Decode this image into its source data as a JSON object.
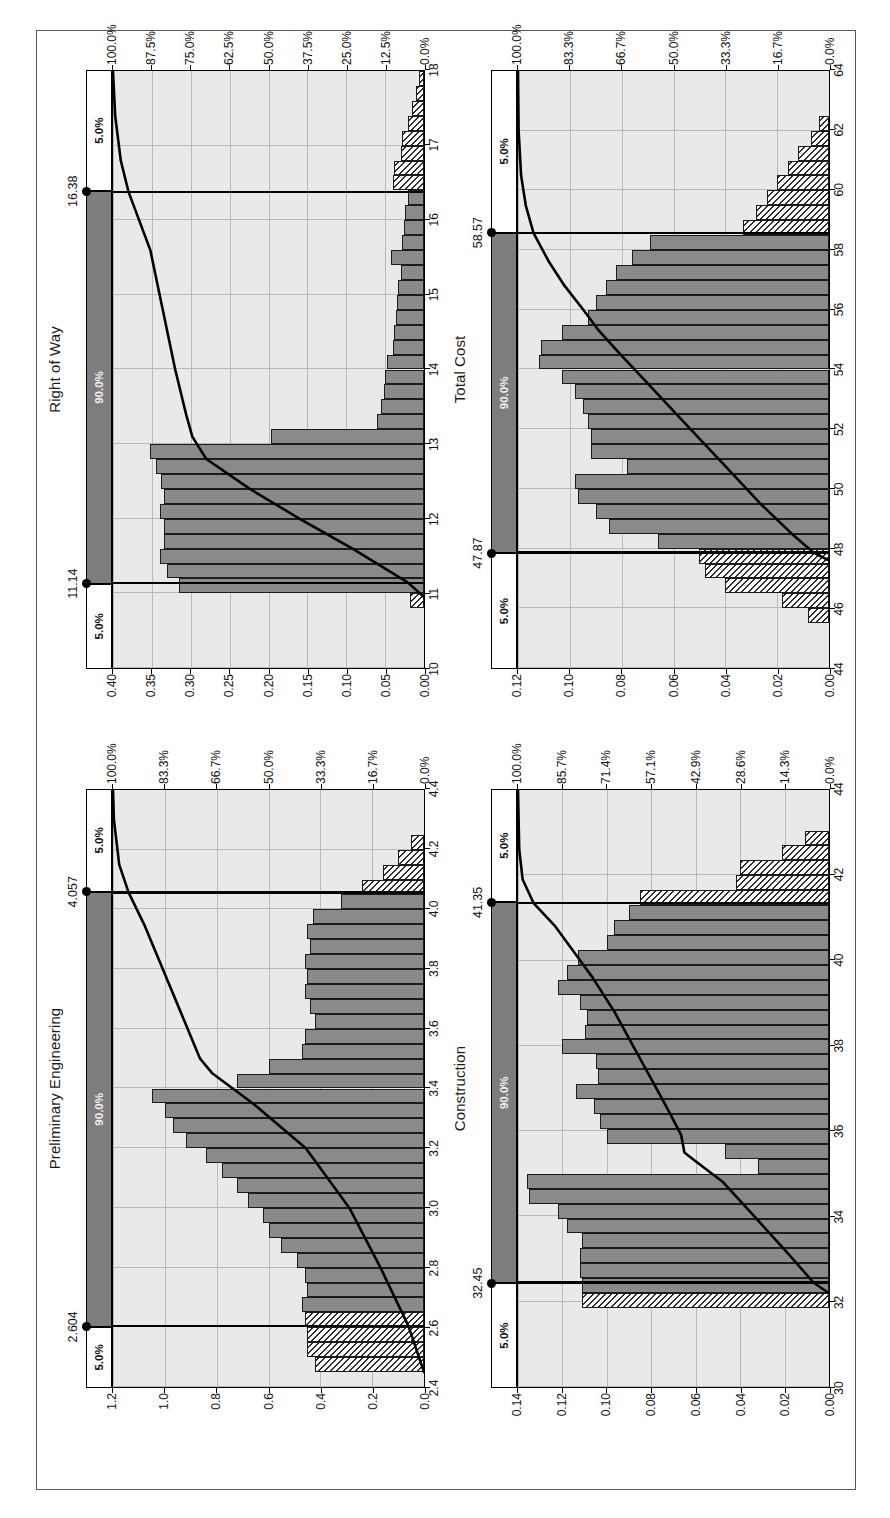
{
  "figure": {
    "orientation": "rotated-90-ccw",
    "panel_count": 4,
    "band_labels": {
      "lower_tail": "5.0%",
      "middle": "90.0%",
      "upper_tail": "5.0%"
    }
  },
  "chart_data": [
    {
      "type": "bar",
      "title": "Preliminary Engineering",
      "xlabel": "",
      "ylabel": "",
      "xlim": [
        2.4,
        4.4
      ],
      "ylim": [
        0.0,
        1.2
      ],
      "xticks": [
        "2.4",
        "2.6",
        "2.8",
        "3.0",
        "3.2",
        "3.4",
        "3.6",
        "3.8",
        "4.0",
        "4.2",
        "4.4"
      ],
      "yticks": [
        "0.0",
        "0.2",
        "0.4",
        "0.6",
        "0.8",
        "1.0",
        "1.2"
      ],
      "secondary_axis": {
        "label": "",
        "ticks": [
          "0.0%",
          "16.7%",
          "33.3%",
          "50.0%",
          "66.7%",
          "83.3%",
          "100.0%"
        ],
        "lim": [
          0,
          100
        ]
      },
      "percentiles": {
        "p5": "2.604",
        "p95": "4.057",
        "band": "90.0%",
        "tail": "5.0%"
      },
      "bin_width": 0.05,
      "bin_starts": [
        2.45,
        2.5,
        2.55,
        2.6,
        2.65,
        2.7,
        2.75,
        2.8,
        2.85,
        2.9,
        2.95,
        3.0,
        3.05,
        3.1,
        3.15,
        3.2,
        3.25,
        3.3,
        3.35,
        3.4,
        3.45,
        3.5,
        3.55,
        3.6,
        3.65,
        3.7,
        3.75,
        3.8,
        3.85,
        3.9,
        3.95,
        4.0,
        4.05,
        4.1,
        4.15,
        4.2
      ],
      "values": [
        0.42,
        0.45,
        0.45,
        0.46,
        0.47,
        0.45,
        0.46,
        0.49,
        0.55,
        0.6,
        0.62,
        0.68,
        0.72,
        0.78,
        0.84,
        0.92,
        0.97,
        1.0,
        1.05,
        0.72,
        0.6,
        0.47,
        0.46,
        0.42,
        0.44,
        0.46,
        0.45,
        0.46,
        0.44,
        0.45,
        0.43,
        0.32,
        0.24,
        0.16,
        0.1,
        0.05
      ],
      "tail_bins_low": [
        2.45,
        2.5,
        2.55,
        2.6
      ],
      "tail_bins_high": [
        4.05,
        4.1,
        4.15,
        4.2
      ],
      "cumulative_curve": [
        {
          "x": 2.45,
          "y": 0.0
        },
        {
          "x": 2.604,
          "y": 5.0
        },
        {
          "x": 2.8,
          "y": 14.0
        },
        {
          "x": 3.0,
          "y": 24.0
        },
        {
          "x": 3.2,
          "y": 38.0
        },
        {
          "x": 3.35,
          "y": 55.0
        },
        {
          "x": 3.45,
          "y": 68.0
        },
        {
          "x": 3.5,
          "y": 72.0
        },
        {
          "x": 3.65,
          "y": 78.0
        },
        {
          "x": 3.8,
          "y": 84.0
        },
        {
          "x": 3.95,
          "y": 90.0
        },
        {
          "x": 4.057,
          "y": 95.0
        },
        {
          "x": 4.15,
          "y": 98.0
        },
        {
          "x": 4.3,
          "y": 99.7
        },
        {
          "x": 4.4,
          "y": 100.0
        }
      ]
    },
    {
      "type": "bar",
      "title": "Right of Way",
      "xlabel": "",
      "ylabel": "",
      "xlim": [
        10,
        18
      ],
      "ylim": [
        0.0,
        0.4
      ],
      "xticks": [
        "10",
        "11",
        "12",
        "13",
        "14",
        "15",
        "16",
        "17",
        "18"
      ],
      "yticks": [
        "0.00",
        "0.05",
        "0.10",
        "0.15",
        "0.20",
        "0.25",
        "0.30",
        "0.35",
        "0.40"
      ],
      "secondary_axis": {
        "label": "",
        "ticks": [
          "0.0%",
          "12.5%",
          "25.0%",
          "37.5%",
          "50.0%",
          "62.5%",
          "75.0%",
          "87.5%",
          "100.0%"
        ],
        "lim": [
          0,
          100
        ]
      },
      "percentiles": {
        "p5": "11.14",
        "p95": "16.38",
        "band": "90.0%",
        "tail": "5.0%"
      },
      "bin_width": 0.2,
      "bin_starts": [
        10.8,
        11.0,
        11.2,
        11.4,
        11.6,
        11.8,
        12.0,
        12.2,
        12.4,
        12.6,
        12.8,
        13.0,
        13.2,
        13.4,
        13.6,
        13.8,
        14.0,
        14.2,
        14.4,
        14.6,
        14.8,
        15.0,
        15.2,
        15.4,
        15.6,
        15.8,
        16.0,
        16.2,
        16.4,
        16.6,
        16.8,
        17.0,
        17.2,
        17.4,
        17.6,
        17.8
      ],
      "values": [
        0.018,
        0.315,
        0.33,
        0.34,
        0.335,
        0.335,
        0.34,
        0.335,
        0.338,
        0.345,
        0.352,
        0.197,
        0.06,
        0.055,
        0.052,
        0.05,
        0.048,
        0.04,
        0.038,
        0.036,
        0.035,
        0.033,
        0.03,
        0.042,
        0.028,
        0.026,
        0.024,
        0.02,
        0.04,
        0.038,
        0.03,
        0.028,
        0.02,
        0.016,
        0.01,
        0.006
      ],
      "tail_bins_low": [
        10.8
      ],
      "tail_bins_high": [
        16.4,
        16.6,
        16.8,
        17.0,
        17.2,
        17.4,
        17.6,
        17.8
      ],
      "cumulative_curve": [
        {
          "x": 10.95,
          "y": 0.0
        },
        {
          "x": 11.14,
          "y": 5.0
        },
        {
          "x": 11.6,
          "y": 23.0
        },
        {
          "x": 12.0,
          "y": 40.0
        },
        {
          "x": 12.4,
          "y": 56.0
        },
        {
          "x": 12.8,
          "y": 70.0
        },
        {
          "x": 13.0,
          "y": 73.0
        },
        {
          "x": 13.1,
          "y": 74.5
        },
        {
          "x": 13.4,
          "y": 76.5
        },
        {
          "x": 14.0,
          "y": 80.0
        },
        {
          "x": 14.8,
          "y": 84.0
        },
        {
          "x": 15.6,
          "y": 88.0
        },
        {
          "x": 16.38,
          "y": 95.0
        },
        {
          "x": 16.8,
          "y": 97.5
        },
        {
          "x": 17.4,
          "y": 99.3
        },
        {
          "x": 18.0,
          "y": 100.0
        }
      ]
    },
    {
      "type": "bar",
      "title": "Construction",
      "xlabel": "",
      "ylabel": "",
      "xlim": [
        30,
        44
      ],
      "ylim": [
        0.0,
        0.14
      ],
      "xticks": [
        "30",
        "32",
        "34",
        "36",
        "38",
        "40",
        "42",
        "44"
      ],
      "yticks": [
        "0.00",
        "0.02",
        "0.04",
        "0.06",
        "0.08",
        "0.10",
        "0.12",
        "0.14"
      ],
      "secondary_axis": {
        "label": "",
        "ticks": [
          "0.0%",
          "14.3%",
          "28.6%",
          "42.9%",
          "57.1%",
          "71.4%",
          "85.7%",
          "100.0%"
        ],
        "lim": [
          0,
          100
        ]
      },
      "percentiles": {
        "p5": "32.45",
        "p95": "41.35",
        "band": "90.0%",
        "tail": "5.0%"
      },
      "bin_width": 0.35,
      "bin_starts": [
        31.85,
        32.2,
        32.55,
        32.9,
        33.25,
        33.6,
        33.95,
        34.3,
        34.65,
        35.0,
        35.35,
        35.7,
        36.05,
        36.4,
        36.75,
        37.1,
        37.45,
        37.8,
        38.15,
        38.5,
        38.85,
        39.2,
        39.55,
        39.9,
        40.25,
        40.6,
        40.95,
        41.3,
        41.65,
        42.0,
        42.35,
        42.7
      ],
      "values": [
        0.111,
        0.111,
        0.112,
        0.112,
        0.111,
        0.118,
        0.122,
        0.135,
        0.136,
        0.032,
        0.047,
        0.1,
        0.103,
        0.106,
        0.114,
        0.104,
        0.105,
        0.12,
        0.11,
        0.109,
        0.112,
        0.122,
        0.118,
        0.113,
        0.1,
        0.097,
        0.09,
        0.085,
        0.042,
        0.04,
        0.021,
        0.011
      ],
      "tail_bins_low": [
        31.85
      ],
      "tail_bins_high": [
        41.3,
        41.65,
        42.0,
        42.35,
        42.7
      ],
      "cumulative_curve": [
        {
          "x": 32.2,
          "y": 0.0
        },
        {
          "x": 32.45,
          "y": 5.0
        },
        {
          "x": 33.2,
          "y": 14.0
        },
        {
          "x": 34.0,
          "y": 24.0
        },
        {
          "x": 34.8,
          "y": 34.0
        },
        {
          "x": 35.3,
          "y": 43.0
        },
        {
          "x": 35.5,
          "y": 46.5
        },
        {
          "x": 35.9,
          "y": 47.5
        },
        {
          "x": 36.4,
          "y": 51.0
        },
        {
          "x": 37.2,
          "y": 57.0
        },
        {
          "x": 38.0,
          "y": 63.0
        },
        {
          "x": 38.8,
          "y": 69.0
        },
        {
          "x": 39.6,
          "y": 76.0
        },
        {
          "x": 40.2,
          "y": 82.0
        },
        {
          "x": 40.8,
          "y": 88.0
        },
        {
          "x": 41.35,
          "y": 95.0
        },
        {
          "x": 41.9,
          "y": 98.5
        },
        {
          "x": 42.6,
          "y": 99.6
        },
        {
          "x": 44.0,
          "y": 100.0
        }
      ]
    },
    {
      "type": "bar",
      "title": "Total Cost",
      "xlabel": "",
      "ylabel": "",
      "xlim": [
        44,
        64
      ],
      "ylim": [
        0.0,
        0.12
      ],
      "xticks": [
        "44",
        "46",
        "48",
        "50",
        "52",
        "54",
        "56",
        "58",
        "60",
        "62",
        "64"
      ],
      "yticks": [
        "0.00",
        "0.02",
        "0.04",
        "0.06",
        "0.08",
        "0.10",
        "0.12"
      ],
      "secondary_axis": {
        "label": "",
        "ticks": [
          "0.0%",
          "16.7%",
          "33.3%",
          "50.0%",
          "66.7%",
          "83.3%",
          "100.0%"
        ],
        "lim": [
          0,
          100
        ]
      },
      "percentiles": {
        "p5": "47.87",
        "p95": "58.57",
        "band": "90.0%",
        "tail": "5.0%"
      },
      "bin_width": 0.5,
      "bin_starts": [
        45.5,
        46.0,
        46.5,
        47.0,
        47.5,
        48.0,
        48.5,
        49.0,
        49.5,
        50.0,
        50.5,
        51.0,
        51.5,
        52.0,
        52.5,
        53.0,
        53.5,
        54.0,
        54.5,
        55.0,
        55.5,
        56.0,
        56.5,
        57.0,
        57.5,
        58.0,
        58.5,
        59.0,
        59.5,
        60.0,
        60.5,
        61.0,
        61.5,
        62.0
      ],
      "values": [
        0.008,
        0.018,
        0.04,
        0.048,
        0.05,
        0.066,
        0.085,
        0.09,
        0.097,
        0.098,
        0.078,
        0.092,
        0.092,
        0.093,
        0.095,
        0.098,
        0.103,
        0.112,
        0.111,
        0.103,
        0.093,
        0.09,
        0.086,
        0.082,
        0.076,
        0.069,
        0.033,
        0.028,
        0.024,
        0.02,
        0.016,
        0.012,
        0.007,
        0.004
      ],
      "tail_bins_low": [
        45.5,
        46.0,
        46.5,
        47.0,
        47.5
      ],
      "tail_bins_high": [
        58.5,
        59.0,
        59.5,
        60.0,
        60.5,
        61.0,
        61.5,
        62.0
      ],
      "cumulative_curve": [
        {
          "x": 47.6,
          "y": 0.0
        },
        {
          "x": 47.87,
          "y": 5.0
        },
        {
          "x": 48.5,
          "y": 12.0
        },
        {
          "x": 49.5,
          "y": 22.0
        },
        {
          "x": 50.5,
          "y": 31.0
        },
        {
          "x": 51.5,
          "y": 40.0
        },
        {
          "x": 52.5,
          "y": 49.0
        },
        {
          "x": 53.5,
          "y": 58.0
        },
        {
          "x": 54.5,
          "y": 67.0
        },
        {
          "x": 55.3,
          "y": 74.0
        },
        {
          "x": 56.0,
          "y": 79.0
        },
        {
          "x": 56.8,
          "y": 85.0
        },
        {
          "x": 57.6,
          "y": 90.0
        },
        {
          "x": 58.57,
          "y": 95.0
        },
        {
          "x": 59.5,
          "y": 97.5
        },
        {
          "x": 60.5,
          "y": 99.0
        },
        {
          "x": 62.0,
          "y": 99.8
        },
        {
          "x": 64.0,
          "y": 100.0
        }
      ]
    }
  ]
}
